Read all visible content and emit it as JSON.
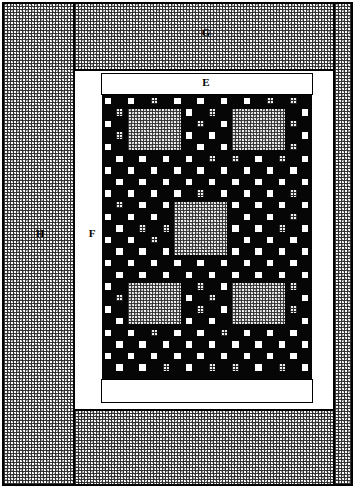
{
  "figure": {
    "width": 356,
    "height": 490,
    "background_color": "#ffffff",
    "line_color": "#000000",
    "core_fill_color": "#060606",
    "stipple_fill_color": "#f0f0f0",
    "white_fill_color": "#ffffff"
  },
  "labels": [
    {
      "id": "E",
      "text": "E",
      "x": 206,
      "y": 83,
      "description": "upper white band inside frame"
    },
    {
      "id": "F",
      "text": "F",
      "x": 92,
      "y": 234,
      "description": "left white vertical band"
    },
    {
      "id": "G",
      "text": "G",
      "x": 206,
      "y": 33,
      "description": "upper stippled region"
    },
    {
      "id": "H",
      "text": "H",
      "x": 40,
      "y": 234,
      "description": "outer left stippled region"
    }
  ],
  "regions": [
    {
      "name": "outer-frame",
      "x": 2,
      "y": 2,
      "w": 351,
      "h": 484,
      "fill": "white",
      "bordered": true
    },
    {
      "name": "region-H-left",
      "x": 3,
      "y": 3,
      "w": 71,
      "h": 482,
      "fill": "stipple",
      "bordered": true
    },
    {
      "name": "region-H-right",
      "x": 334,
      "y": 3,
      "w": 18,
      "h": 482,
      "fill": "stipple",
      "bordered": true
    },
    {
      "name": "region-G-top",
      "x": 74,
      "y": 3,
      "w": 260,
      "h": 67,
      "fill": "stipple",
      "bordered": true
    },
    {
      "name": "region-G-bottom",
      "x": 74,
      "y": 410,
      "w": 260,
      "h": 75,
      "fill": "stipple",
      "bordered": true
    },
    {
      "name": "region-F-white",
      "x": 74,
      "y": 70,
      "w": 260,
      "h": 340,
      "fill": "white",
      "bordered": true
    },
    {
      "name": "band-E-top",
      "x": 101,
      "y": 73,
      "w": 212,
      "h": 22,
      "fill": "white",
      "bordered": true
    },
    {
      "name": "band-E-bottom",
      "x": 101,
      "y": 379,
      "w": 212,
      "h": 24,
      "fill": "white",
      "bordered": true
    }
  ],
  "core": {
    "name": "checkerboard-core",
    "x": 102,
    "y": 95,
    "w": 210,
    "h": 284,
    "cols": 18,
    "rows": 24,
    "cell": 11.6,
    "pad": 2.6,
    "description": "dense black field with alternating white and stippled pads, three large stippled inset blocks",
    "stipple_cells": [
      [
        0,
        3
      ],
      [
        0,
        4
      ],
      [
        0,
        5
      ],
      [
        0,
        11
      ],
      [
        0,
        14
      ],
      [
        0,
        15
      ],
      [
        0,
        16
      ],
      [
        1,
        1
      ],
      [
        1,
        8
      ],
      [
        1,
        9
      ],
      [
        1,
        16
      ],
      [
        2,
        1
      ],
      [
        2,
        8
      ],
      [
        2,
        9
      ],
      [
        2,
        16
      ],
      [
        3,
        1
      ],
      [
        3,
        8
      ],
      [
        3,
        16
      ],
      [
        4,
        3
      ],
      [
        4,
        4
      ],
      [
        4,
        5
      ],
      [
        4,
        11
      ],
      [
        4,
        14
      ],
      [
        4,
        15
      ],
      [
        4,
        16
      ],
      [
        5,
        4
      ],
      [
        5,
        9
      ],
      [
        5,
        10
      ],
      [
        5,
        11
      ],
      [
        5,
        15
      ],
      [
        8,
        1
      ],
      [
        8,
        8
      ],
      [
        8,
        9
      ],
      [
        8,
        16
      ],
      [
        9,
        1
      ],
      [
        9,
        8
      ],
      [
        9,
        9
      ],
      [
        9,
        16
      ],
      [
        10,
        1
      ],
      [
        10,
        8
      ],
      [
        10,
        16
      ],
      [
        11,
        3
      ],
      [
        11,
        4
      ],
      [
        11,
        5
      ],
      [
        11,
        9
      ],
      [
        11,
        10
      ],
      [
        11,
        14
      ],
      [
        11,
        15
      ],
      [
        11,
        16
      ],
      [
        12,
        4
      ],
      [
        12,
        10
      ],
      [
        12,
        15
      ],
      [
        16,
        1
      ],
      [
        16,
        8
      ],
      [
        16,
        9
      ],
      [
        16,
        16
      ],
      [
        17,
        1
      ],
      [
        17,
        8
      ],
      [
        17,
        9
      ],
      [
        17,
        16
      ],
      [
        18,
        1
      ],
      [
        18,
        8
      ],
      [
        18,
        16
      ],
      [
        19,
        3
      ],
      [
        19,
        4
      ],
      [
        19,
        5
      ],
      [
        19,
        10
      ],
      [
        19,
        14
      ],
      [
        19,
        15
      ],
      [
        19,
        16
      ],
      [
        20,
        4
      ],
      [
        20,
        9
      ],
      [
        20,
        10
      ],
      [
        20,
        11
      ],
      [
        20,
        15
      ],
      [
        23,
        4
      ],
      [
        23,
        5
      ],
      [
        23,
        9
      ],
      [
        23,
        10
      ],
      [
        23,
        11
      ],
      [
        23,
        14
      ],
      [
        23,
        15
      ]
    ],
    "inset_blocks": [
      {
        "name": "inset-block-top-left",
        "col": 2,
        "row": 1,
        "cols": 5,
        "rows": 4
      },
      {
        "name": "inset-block-top-right",
        "col": 11,
        "row": 1,
        "cols": 5,
        "rows": 4
      },
      {
        "name": "inset-block-center",
        "col": 6,
        "row": 9,
        "cols": 5,
        "rows": 5
      },
      {
        "name": "inset-block-bottom-left",
        "col": 2,
        "row": 16,
        "cols": 5,
        "rows": 4
      },
      {
        "name": "inset-block-bottom-right",
        "col": 11,
        "row": 16,
        "cols": 5,
        "rows": 4
      }
    ]
  }
}
